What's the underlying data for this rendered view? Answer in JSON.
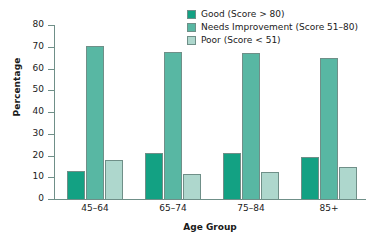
{
  "chart_data": {
    "type": "bar",
    "title": "",
    "xlabel": "Age Group",
    "ylabel": "Percentage",
    "categories": [
      "45–64",
      "65–74",
      "75–84",
      "85+"
    ],
    "ylim": [
      0,
      80
    ],
    "yticks": [
      0,
      10,
      20,
      30,
      40,
      50,
      60,
      70,
      80
    ],
    "grid": false,
    "legend_position": "top-right",
    "series": [
      {
        "name": "Good (Score > 80)",
        "color": "#13a183",
        "values": [
          13,
          21,
          21,
          19.5
        ]
      },
      {
        "name": "Needs Improvement (Score 51–80)",
        "color": "#58b7a3",
        "values": [
          70.5,
          67.5,
          67,
          65
        ]
      },
      {
        "name": "Poor (Score < 51)",
        "color": "#aed7cd",
        "values": [
          18,
          11.5,
          12.5,
          14.5
        ]
      }
    ]
  },
  "axis": {
    "outline_color": "#6f8f88",
    "tick_labels": [
      "0",
      "10",
      "20",
      "30",
      "40",
      "50",
      "60",
      "70",
      "80"
    ]
  }
}
